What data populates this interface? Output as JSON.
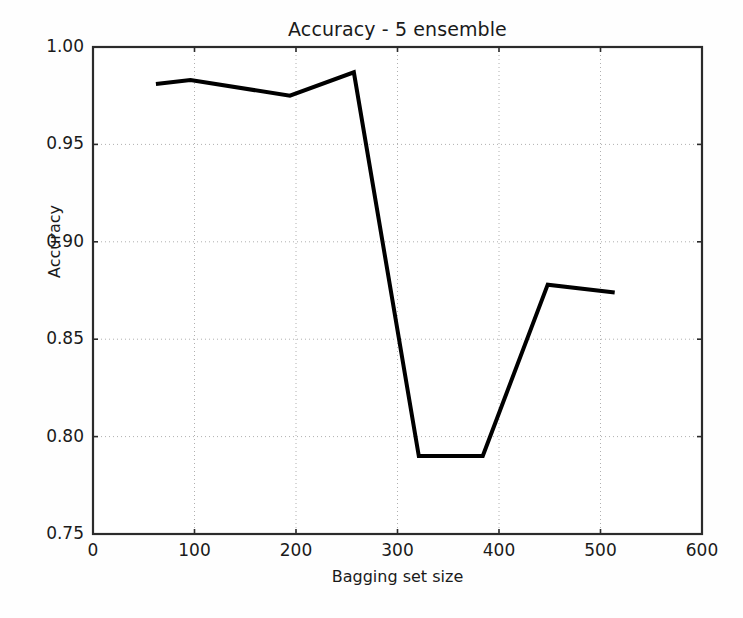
{
  "chart_data": {
    "type": "line",
    "title": "Accuracy - 5 ensemble",
    "xlabel": "Bagging set size",
    "ylabel": "Accuracy",
    "xlim": [
      0,
      600
    ],
    "ylim": [
      0.75,
      1.0
    ],
    "xticks": [
      0,
      100,
      200,
      300,
      400,
      500,
      600
    ],
    "xtick_labels": [
      "0",
      "100",
      "200",
      "300",
      "400",
      "500",
      "600"
    ],
    "yticks": [
      0.75,
      0.8,
      0.85,
      0.9,
      0.95,
      1.0
    ],
    "ytick_labels": [
      "0.75",
      "0.80",
      "0.85",
      "0.90",
      "0.95",
      "1.00"
    ],
    "grid": true,
    "grid_style": "dotted",
    "grid_color": "#b0b0b0",
    "legend": null,
    "line_color": "#000000",
    "line_width": 4,
    "background_color": "#fefefe",
    "axis_color": "#2b2b2b",
    "series": [
      {
        "name": "Accuracy",
        "x": [
          62,
          96,
          194,
          257,
          321,
          384,
          448,
          514
        ],
        "values": [
          0.981,
          0.983,
          0.975,
          0.987,
          0.79,
          0.79,
          0.878,
          0.874
        ]
      }
    ]
  }
}
